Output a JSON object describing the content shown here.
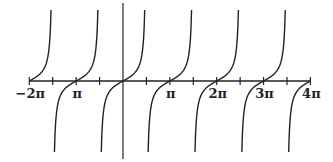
{
  "chart_data": {
    "type": "line",
    "title": "",
    "function": "y = tan(x)",
    "xlabel": "",
    "ylabel": "",
    "x_range": [
      "-2π",
      "4π"
    ],
    "xlim": [
      -6.2832,
      12.5664
    ],
    "ylim": [
      -6,
      6
    ],
    "grid": false,
    "legend": null,
    "tick_labels": [
      "−2π",
      "π",
      "π",
      "2π",
      "3π",
      "4π"
    ],
    "tick_label_positions": [
      -6.2832,
      -3.1416,
      3.1416,
      6.2832,
      9.4248,
      12.5664
    ],
    "minor_ticks_at": "odd multiples of π/2",
    "zeros": [
      -6.2832,
      -3.1416,
      0,
      3.1416,
      6.2832,
      9.4248,
      12.5664
    ],
    "asymptotes": [
      -4.7124,
      -1.5708,
      1.5708,
      4.7124,
      7.854,
      10.9956
    ],
    "series": [
      {
        "name": "tan(x)",
        "color": "#222222"
      }
    ]
  },
  "colors": {
    "curve": "#222222",
    "axis": "#222222",
    "background": "#ffffff"
  }
}
